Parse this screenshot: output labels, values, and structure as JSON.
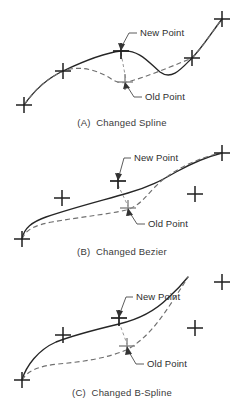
{
  "figure": {
    "background_color": "#ffffff",
    "curve_new_color": "#262626",
    "curve_old_color": "#6f6f6f",
    "marker_new_color": "#1f1f1f",
    "marker_old_color": "#8d8d8d"
  },
  "labels": {
    "new_point": "New Point",
    "old_point": "Old Point"
  },
  "panels": [
    {
      "id": "a",
      "caption": "(A)  Changed Spline",
      "new_point_label": "New Point",
      "old_point_label": "Old Point",
      "curve_type": "spline",
      "control_points": [
        {
          "x": 24,
          "y": 105,
          "kind": "control"
        },
        {
          "x": 63,
          "y": 71,
          "kind": "control"
        },
        {
          "x": 121,
          "y": 51,
          "kind": "new"
        },
        {
          "x": 125,
          "y": 82,
          "kind": "old"
        },
        {
          "x": 192,
          "y": 58,
          "kind": "control"
        },
        {
          "x": 222,
          "y": 19,
          "kind": "control"
        }
      ]
    },
    {
      "id": "b",
      "caption": "(B)  Changed Bezier",
      "new_point_label": "New Point",
      "old_point_label": "Old Point",
      "curve_type": "bezier",
      "control_points": [
        {
          "x": 22,
          "y": 103,
          "kind": "control"
        },
        {
          "x": 62,
          "y": 62,
          "kind": "control"
        },
        {
          "x": 118,
          "y": 45,
          "kind": "new"
        },
        {
          "x": 128,
          "y": 72,
          "kind": "old"
        },
        {
          "x": 195,
          "y": 58,
          "kind": "control"
        },
        {
          "x": 222,
          "y": 17,
          "kind": "control"
        }
      ]
    },
    {
      "id": "c",
      "caption": "(C)  Changed B-Spline",
      "new_point_label": "New Point",
      "old_point_label": "Old Point",
      "curve_type": "b-spline",
      "control_points": [
        {
          "x": 22,
          "y": 110,
          "kind": "control"
        },
        {
          "x": 63,
          "y": 65,
          "kind": "control"
        },
        {
          "x": 119,
          "y": 48,
          "kind": "new"
        },
        {
          "x": 127,
          "y": 76,
          "kind": "old"
        },
        {
          "x": 195,
          "y": 58,
          "kind": "control"
        },
        {
          "x": 222,
          "y": 17,
          "kind": "control"
        }
      ]
    }
  ]
}
